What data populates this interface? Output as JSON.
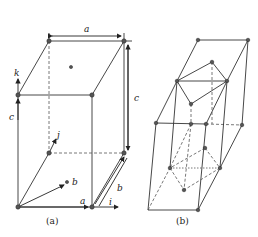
{
  "figure": {
    "panel_a": {
      "caption": "(a)",
      "labels": {
        "a_top": "a",
        "c_right": "c",
        "c_left": "c",
        "k": "k",
        "j": "j",
        "b_vec": "b",
        "a_vec": "a",
        "b_side": "b",
        "i": "i"
      }
    },
    "panel_b": {
      "caption": "(b)"
    }
  }
}
